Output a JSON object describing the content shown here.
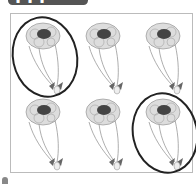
{
  "header": {
    "label": "▪ ▪ ▪"
  },
  "puzzle": {
    "description": "Find the two identical bouquets",
    "grid": {
      "rows": 2,
      "cols": 3
    },
    "items": [
      {
        "id": 1,
        "row": 0,
        "col": 0,
        "circled": true
      },
      {
        "id": 2,
        "row": 0,
        "col": 1,
        "circled": false
      },
      {
        "id": 3,
        "row": 0,
        "col": 2,
        "circled": false
      },
      {
        "id": 4,
        "row": 1,
        "col": 0,
        "circled": false
      },
      {
        "id": 5,
        "row": 1,
        "col": 1,
        "circled": false
      },
      {
        "id": 6,
        "row": 1,
        "col": 2,
        "circled": true
      }
    ],
    "colors": {
      "flowers": "#777777",
      "flower_center": "#333333",
      "stems": "#999999",
      "circle": "#222222",
      "frame": "#bbbbbb"
    }
  }
}
